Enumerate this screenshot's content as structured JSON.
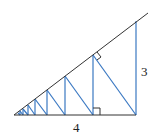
{
  "diagram": {
    "labels": {
      "height": "3",
      "base": "4"
    },
    "colors": {
      "outline": "#333333",
      "perpendiculars": "#3a78c2"
    }
  }
}
